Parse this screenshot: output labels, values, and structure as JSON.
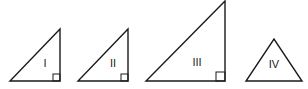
{
  "diagram": {
    "stroke_color": "#1a1a1a",
    "background": "#ffffff",
    "triangles": [
      {
        "label": "I",
        "type": "right",
        "points": [
          [
            10,
            81
          ],
          [
            60,
            81
          ],
          [
            60,
            29
          ]
        ],
        "right_angle_box": [
          53,
          74,
          7,
          7
        ],
        "label_pos": [
          45,
          63
        ]
      },
      {
        "label": "II",
        "type": "right",
        "points": [
          [
            78,
            81
          ],
          [
            128,
            81
          ],
          [
            128,
            29
          ]
        ],
        "right_angle_box": [
          121,
          74,
          7,
          7
        ],
        "label_pos": [
          113,
          63
        ]
      },
      {
        "label": "III",
        "type": "right",
        "points": [
          [
            146,
            81
          ],
          [
            225,
            81
          ],
          [
            225,
            1
          ]
        ],
        "right_angle_box": [
          216,
          72,
          9,
          9
        ],
        "label_pos": [
          197,
          62
        ]
      },
      {
        "label": "IV",
        "type": "isosceles",
        "points": [
          [
            246,
            81
          ],
          [
            302,
            81
          ],
          [
            274,
            39
          ]
        ],
        "right_angle_box": null,
        "label_pos": [
          274,
          64
        ]
      }
    ]
  }
}
